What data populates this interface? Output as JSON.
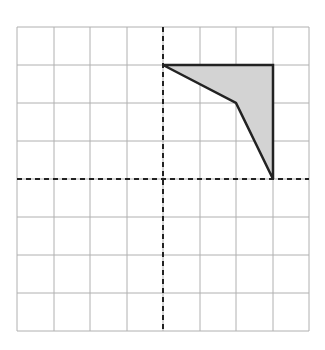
{
  "diagram": {
    "type": "coordinate-grid-polygon",
    "grid": {
      "columns": 8,
      "rows": 8,
      "x_lines": [
        17,
        54,
        90,
        127,
        163,
        200,
        236,
        273,
        309
      ],
      "y_lines": [
        27,
        65,
        103,
        141,
        179,
        217,
        255,
        293,
        331
      ],
      "line_color": "#b0b0b0"
    },
    "axes": {
      "x_axis_y": 179,
      "y_axis_x": 163,
      "style": "dashed",
      "color": "#222222"
    },
    "polygon": {
      "grid_vertices": [
        [
          0,
          3
        ],
        [
          3,
          3
        ],
        [
          3,
          0
        ],
        [
          2,
          2
        ]
      ],
      "pixel_vertices": [
        [
          163,
          65
        ],
        [
          273,
          65
        ],
        [
          273,
          179
        ],
        [
          236,
          103
        ]
      ],
      "fill": "#d3d3d3",
      "stroke": "#222222"
    }
  }
}
